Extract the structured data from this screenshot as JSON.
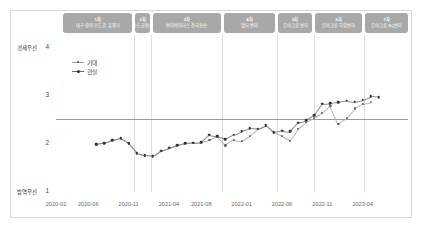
{
  "chart_data": {
    "type": "line",
    "title": "",
    "xlabel": "",
    "ylabel": "",
    "ylim": [
      1,
      4
    ],
    "yticks": [
      1,
      2,
      3,
      4
    ],
    "ytick_labels": [
      "1",
      "2",
      "3",
      "4"
    ],
    "y_axis_top_label": "경제우선",
    "y_axis_bottom_label": "방역우선",
    "xtick_labels": [
      "2020-02",
      "2020-06",
      "2020-11",
      "2021-04",
      "2021-08",
      "2022-01",
      "2022-06",
      "2022-11",
      "2023-04"
    ],
    "xtick_index": [
      0,
      4,
      9,
      14,
      18,
      23,
      28,
      33,
      38
    ],
    "grid": false,
    "reference_line": 2.5,
    "legend_position": "upper-left",
    "series": [
      {
        "name": "기대",
        "color": "#4a4a4a",
        "x": [
          5,
          6,
          7,
          8,
          9,
          10,
          11,
          12,
          13,
          14,
          15,
          16,
          17,
          18,
          19,
          20,
          21,
          22,
          23,
          24,
          25,
          26,
          27,
          28,
          29,
          30,
          31,
          32,
          33,
          34,
          35,
          36,
          37,
          38,
          39
        ],
        "values": [
          1.97,
          2.0,
          2.06,
          2.1,
          1.99,
          1.79,
          1.74,
          1.73,
          1.84,
          1.9,
          1.96,
          2.0,
          2.01,
          2.02,
          2.06,
          2.14,
          1.95,
          2.07,
          2.04,
          2.15,
          2.3,
          2.37,
          2.22,
          2.14,
          2.05,
          2.3,
          2.44,
          2.52,
          2.63,
          2.78,
          2.4,
          2.52,
          2.72,
          2.82,
          2.85
        ]
      },
      {
        "name": "현실",
        "color": "#333333",
        "x": [
          5,
          6,
          7,
          8,
          9,
          10,
          11,
          12,
          13,
          14,
          15,
          16,
          17,
          18,
          19,
          20,
          21,
          22,
          23,
          24,
          25,
          26,
          27,
          28,
          29,
          30,
          31,
          32,
          33,
          34,
          35,
          36,
          37,
          38,
          39,
          40
        ],
        "values": [
          1.97,
          2.0,
          2.06,
          2.1,
          1.99,
          1.79,
          1.74,
          1.73,
          1.84,
          1.9,
          1.96,
          2.0,
          2.01,
          2.02,
          2.17,
          2.14,
          2.08,
          2.17,
          2.25,
          2.31,
          2.3,
          2.37,
          2.22,
          2.26,
          2.24,
          2.42,
          2.47,
          2.58,
          2.82,
          2.83,
          2.85,
          2.88,
          2.86,
          2.9,
          2.97,
          2.96
        ]
      }
    ]
  },
  "phases": [
    {
      "num": "1차",
      "label": "대구·경북·수도권 유행기"
    },
    {
      "num": "2차",
      "label": "수도권확산"
    },
    {
      "num": "3차",
      "label": "변이바이러스 전국확산"
    },
    {
      "num": "4차",
      "label": "델타 변이"
    },
    {
      "num": "5차",
      "label": "오미크론 변이"
    },
    {
      "num": "6차",
      "label": "오미크론 하위변이"
    },
    {
      "num": "7차",
      "label": "오미크론 BQ변이"
    }
  ],
  "legend": [
    {
      "label": "기대"
    },
    {
      "label": "현실"
    }
  ],
  "colors": {
    "phase_bar": "#a8a8a8",
    "reference_line": "#9a9a9a",
    "divider": "#dedede",
    "card_border": "#d8d8d8",
    "text": "#4a4a4a"
  }
}
